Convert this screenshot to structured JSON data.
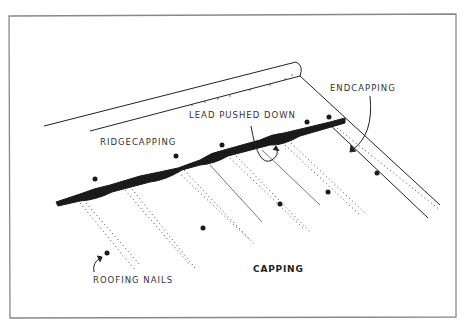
{
  "diagram": {
    "title": "CAPPING",
    "labels": {
      "lead_pushed_down": "LEAD PUSHED DOWN",
      "ridgecapping": "RIDGECAPPING",
      "endcapping": "ENDCAPPING",
      "roofing_nails": "ROOFING NAILS"
    },
    "colors": {
      "frame": "#777777",
      "ink": "#1a1a1a",
      "text": "#333333",
      "background": "#ffffff"
    }
  }
}
